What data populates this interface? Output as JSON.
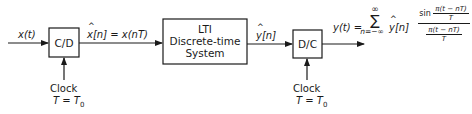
{
  "diagram": {
    "input": {
      "label": "x(t)"
    },
    "cd_converter": {
      "label": "C/D"
    },
    "cd_output": {
      "label": "x[n] = x(nT)",
      "symbol": "x",
      "rest": "[n] = x(nT)"
    },
    "lti_system": {
      "line1": "LTI",
      "line2": "Discrete-time",
      "line3": "System"
    },
    "lti_output": {
      "symbol": "y",
      "rest": "[n]"
    },
    "dc_converter": {
      "label": "D/C"
    },
    "cd_clock": {
      "line1": "Clock",
      "line2": "T = T",
      "subscript": "0"
    },
    "dc_clock": {
      "line1": "Clock",
      "line2": "T = T",
      "subscript": "0"
    },
    "output_formula": {
      "lhs": "y(t) =",
      "sum_symbol": "∑",
      "sum_upper": "∞",
      "sum_lower": "n=−∞",
      "term_symbol": "y",
      "term_rest": "[n]",
      "sin_word": "sin",
      "inner_num": "π(t − nT)",
      "inner_den": "T",
      "outer_num": "π(t − nT)",
      "outer_den": "T"
    },
    "line_color": "#1a1a1a"
  }
}
